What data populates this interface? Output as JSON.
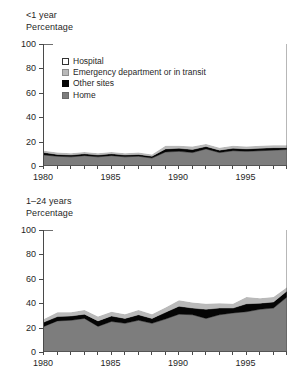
{
  "figure": {
    "panels": [
      {
        "id": "under-1-year",
        "age_group": "<1 year",
        "unit_label": "Percentage"
      },
      {
        "id": "1-24-years",
        "age_group": "1–24 years",
        "unit_label": "Percentage"
      }
    ],
    "legend": {
      "items": [
        {
          "label": "Hospital",
          "color": "#ffffff",
          "swatch": "hospital-swatch"
        },
        {
          "label": "Emergency department or in transit",
          "color": "#b9b9b9",
          "swatch": "ed-swatch"
        },
        {
          "label": "Other sites",
          "color": "#050505",
          "swatch": "other-sites-swatch"
        },
        {
          "label": "Home",
          "color": "#7d7d7d",
          "swatch": "home-swatch"
        }
      ]
    }
  },
  "chart_data": [
    {
      "type": "area",
      "stacked": true,
      "id": "under-1-year",
      "title": "<1 year",
      "subtitle": "Percentage",
      "xlabel": "",
      "ylabel": "Percentage",
      "xlim": [
        1980,
        1998
      ],
      "ylim": [
        0,
        100
      ],
      "yticks": [
        0,
        20,
        40,
        60,
        80,
        100
      ],
      "xticks": [
        1980,
        1985,
        1990,
        1995
      ],
      "xtick_minor_step": 1,
      "grid": false,
      "legend_position": "inside-upper-left",
      "x": [
        1980,
        1981,
        1982,
        1983,
        1984,
        1985,
        1986,
        1987,
        1988,
        1989,
        1990,
        1991,
        1992,
        1993,
        1994,
        1995,
        1996,
        1997,
        1998
      ],
      "series": [
        {
          "name": "Home",
          "color": "#7d7d7d",
          "values": [
            9.0,
            8.0,
            7.5,
            8.5,
            7.5,
            8.5,
            7.5,
            8.0,
            6.5,
            11.5,
            12.0,
            11.0,
            14.0,
            11.0,
            12.5,
            12.0,
            12.5,
            13.0,
            13.5
          ]
        },
        {
          "name": "Other sites",
          "color": "#050505",
          "values": [
            2.0,
            1.5,
            1.5,
            1.5,
            1.5,
            1.5,
            1.5,
            1.5,
            1.5,
            2.5,
            2.5,
            2.5,
            2.0,
            2.0,
            2.0,
            2.0,
            2.0,
            2.0,
            1.5
          ]
        },
        {
          "name": "Emergency department or in transit",
          "color": "#b9b9b9",
          "values": [
            1.5,
            1.5,
            1.5,
            1.5,
            1.5,
            1.5,
            1.5,
            1.5,
            1.5,
            2.5,
            2.0,
            2.5,
            2.0,
            2.0,
            2.0,
            2.0,
            2.0,
            2.0,
            2.0
          ]
        },
        {
          "name": "Hospital",
          "color": "#ffffff",
          "values": [
            87.5,
            89.0,
            89.5,
            88.5,
            89.5,
            88.5,
            89.5,
            89.0,
            90.5,
            83.5,
            83.5,
            84.0,
            82.0,
            85.0,
            83.5,
            84.0,
            83.5,
            83.0,
            83.0
          ]
        }
      ]
    },
    {
      "type": "area",
      "stacked": true,
      "id": "1-24-years",
      "title": "1–24 years",
      "subtitle": "Percentage",
      "xlabel": "",
      "ylabel": "Percentage",
      "xlim": [
        1980,
        1998
      ],
      "ylim": [
        0,
        100
      ],
      "yticks": [
        0,
        20,
        40,
        60,
        80,
        100
      ],
      "xticks": [
        1980,
        1985,
        1990,
        1995
      ],
      "xtick_minor_step": 1,
      "grid": false,
      "legend_position": "none",
      "x": [
        1980,
        1981,
        1982,
        1983,
        1984,
        1985,
        1986,
        1987,
        1988,
        1989,
        1990,
        1991,
        1992,
        1993,
        1994,
        1995,
        1996,
        1997,
        1998
      ],
      "series": [
        {
          "name": "Home",
          "color": "#7d7d7d",
          "values": [
            21.0,
            25.5,
            26.0,
            27.5,
            21.0,
            25.0,
            23.5,
            26.0,
            23.5,
            27.0,
            31.0,
            30.5,
            27.5,
            30.5,
            32.0,
            33.0,
            35.0,
            36.0,
            45.0
          ]
        },
        {
          "name": "Other sites",
          "color": "#050505",
          "values": [
            3.5,
            3.5,
            3.5,
            3.5,
            4.5,
            4.5,
            4.0,
            4.5,
            4.0,
            5.5,
            6.5,
            5.5,
            7.5,
            5.5,
            4.0,
            6.5,
            5.0,
            5.0,
            5.0
          ]
        },
        {
          "name": "Emergency department or in transit",
          "color": "#b9b9b9",
          "values": [
            2.5,
            3.5,
            3.0,
            3.5,
            3.5,
            3.5,
            3.5,
            4.0,
            3.5,
            4.0,
            5.0,
            4.5,
            4.5,
            4.0,
            3.5,
            5.5,
            4.0,
            4.0,
            3.0
          ]
        },
        {
          "name": "Hospital",
          "color": "#ffffff",
          "values": [
            73.0,
            67.5,
            67.5,
            65.5,
            71.0,
            67.0,
            69.0,
            65.5,
            69.0,
            63.5,
            57.5,
            59.5,
            60.5,
            60.0,
            60.5,
            55.0,
            56.0,
            55.0,
            47.0
          ]
        }
      ]
    }
  ]
}
